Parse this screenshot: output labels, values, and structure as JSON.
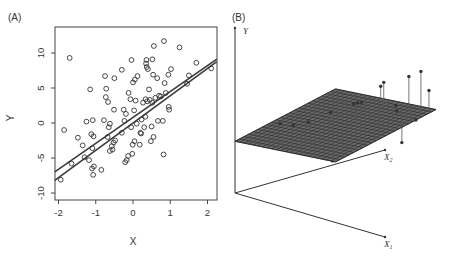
{
  "chart_data": [
    {
      "panel": "A",
      "type": "scatter",
      "panel_label": "(A)",
      "xlabel": "X",
      "ylabel": "Y",
      "xlim": [
        -2.1,
        2.25
      ],
      "ylim": [
        -10.9,
        13.6
      ],
      "xticks": [
        -2,
        -1,
        0,
        1,
        2
      ],
      "yticks": [
        -10,
        -5,
        0,
        5,
        10
      ],
      "xtick_labels": [
        "-2",
        "-1",
        "0",
        "1",
        "2"
      ],
      "ytick_labels": [
        "-10",
        "-5",
        "0",
        "5",
        "10"
      ],
      "grid": false,
      "marker": "open-circle",
      "points": [
        [
          -1.94,
          -8.1
        ],
        [
          -1.85,
          -1.0
        ],
        [
          -1.7,
          9.3
        ],
        [
          -1.65,
          -5.8
        ],
        [
          -1.48,
          -2.1
        ],
        [
          -1.35,
          -3.2
        ],
        [
          -1.3,
          -4.9
        ],
        [
          -1.25,
          0.2
        ],
        [
          -1.18,
          -5.3
        ],
        [
          -1.15,
          4.8
        ],
        [
          -1.12,
          -1.6
        ],
        [
          -1.1,
          -6.5
        ],
        [
          -1.09,
          -3.6
        ],
        [
          -1.08,
          0.4
        ],
        [
          -1.07,
          -7.4
        ],
        [
          -1.06,
          -1.9
        ],
        [
          -1.05,
          -6.2
        ],
        [
          -0.85,
          -6.7
        ],
        [
          -0.78,
          0.4
        ],
        [
          -0.75,
          6.7
        ],
        [
          -0.73,
          3.7
        ],
        [
          -0.72,
          4.9
        ],
        [
          -0.68,
          -2.0
        ],
        [
          -0.67,
          3.0
        ],
        [
          -0.65,
          -0.6
        ],
        [
          -0.62,
          -0.1
        ],
        [
          -0.62,
          -4.0
        ],
        [
          -0.57,
          -3.3
        ],
        [
          -0.55,
          -3.8
        ],
        [
          -0.52,
          -2.8
        ],
        [
          -0.51,
          1.9
        ],
        [
          -0.5,
          6.4
        ],
        [
          -0.48,
          -2.5
        ],
        [
          -0.3,
          7.6
        ],
        [
          -0.3,
          -1.4
        ],
        [
          -0.25,
          1.9
        ],
        [
          -0.23,
          0.3
        ],
        [
          -0.21,
          -5.6
        ],
        [
          -0.19,
          1.3
        ],
        [
          -0.17,
          -5.3
        ],
        [
          -0.13,
          -4.7
        ],
        [
          -0.12,
          4.3
        ],
        [
          -0.07,
          3.4
        ],
        [
          -0.05,
          -0.6
        ],
        [
          -0.04,
          9.0
        ],
        [
          -0.02,
          -4.4
        ],
        [
          -0.01,
          -3.1
        ],
        [
          0.0,
          5.8
        ],
        [
          0.03,
          1.8
        ],
        [
          0.04,
          -2.6
        ],
        [
          0.05,
          6.2
        ],
        [
          0.07,
          3.2
        ],
        [
          0.1,
          -0.1
        ],
        [
          0.12,
          6.7
        ],
        [
          0.18,
          -3.1
        ],
        [
          0.2,
          -1.4
        ],
        [
          0.22,
          -1.5
        ],
        [
          0.23,
          0.5
        ],
        [
          0.27,
          2.9
        ],
        [
          0.3,
          -0.6
        ],
        [
          0.33,
          0.9
        ],
        [
          0.34,
          3.4
        ],
        [
          0.35,
          8.5
        ],
        [
          0.36,
          9.0
        ],
        [
          0.37,
          8.0
        ],
        [
          0.38,
          3.1
        ],
        [
          0.4,
          7.7
        ],
        [
          0.43,
          4.8
        ],
        [
          0.45,
          3.3
        ],
        [
          0.48,
          -2.6
        ],
        [
          0.5,
          -0.5
        ],
        [
          0.52,
          9.1
        ],
        [
          0.52,
          2.9
        ],
        [
          0.54,
          6.9
        ],
        [
          0.55,
          -2.0
        ],
        [
          0.56,
          11.0
        ],
        [
          0.6,
          3.6
        ],
        [
          0.65,
          6.4
        ],
        [
          0.67,
          0.3
        ],
        [
          0.7,
          3.9
        ],
        [
          0.75,
          3.8
        ],
        [
          0.8,
          0.3
        ],
        [
          0.82,
          -4.5
        ],
        [
          0.83,
          11.7
        ],
        [
          0.85,
          5.7
        ],
        [
          0.88,
          4.3
        ],
        [
          0.95,
          6.9
        ],
        [
          0.96,
          2.3
        ],
        [
          0.97,
          1.9
        ],
        [
          1.02,
          7.7
        ],
        [
          1.25,
          10.8
        ],
        [
          1.45,
          5.6
        ],
        [
          1.5,
          6.8
        ],
        [
          1.7,
          8.6
        ],
        [
          2.1,
          7.8
        ]
      ],
      "lines": [
        {
          "name": "population-regression-line",
          "intercept": 0.8,
          "slope": 3.7
        },
        {
          "name": "least-squares-line",
          "intercept": 0.0,
          "slope": 3.9
        }
      ]
    },
    {
      "panel": "B",
      "type": "scatter3d",
      "panel_label": "(B)",
      "axis_labels": {
        "y": "Y",
        "x1": "X",
        "x1_sub": "1",
        "x2": "X",
        "x2_sub": "2"
      },
      "surface": "least-squares regression plane",
      "points": [
        {
          "x1": 0.1,
          "x2": 0.35,
          "y": 0.72
        },
        {
          "x1": 0.28,
          "x2": 0.3,
          "y": 0.8
        },
        {
          "x1": 0.3,
          "x2": 0.32,
          "y": 0.55
        },
        {
          "x1": 0.33,
          "x2": 0.4,
          "y": 0.78
        },
        {
          "x1": 0.35,
          "x2": 0.42,
          "y": 0.58
        },
        {
          "x1": 0.45,
          "x2": 0.5,
          "y": 0.9
        },
        {
          "x1": 0.48,
          "x2": 0.3,
          "y": 0.4
        },
        {
          "x1": 0.52,
          "x2": 0.38,
          "y": 0.48
        },
        {
          "x1": 0.53,
          "x2": 0.4,
          "y": 0.52
        },
        {
          "x1": 0.55,
          "x2": 0.42,
          "y": 0.2
        },
        {
          "x1": 0.56,
          "x2": 0.44,
          "y": 0.5
        },
        {
          "x1": 0.58,
          "x2": 0.6,
          "y": 1.0
        },
        {
          "x1": 0.6,
          "x2": 0.62,
          "y": 1.0
        },
        {
          "x1": 0.62,
          "x2": 0.64,
          "y": 1.0
        },
        {
          "x1": 0.65,
          "x2": 0.4,
          "y": 0.55
        },
        {
          "x1": 0.67,
          "x2": 0.42,
          "y": 0.45
        },
        {
          "x1": 0.7,
          "x2": 0.75,
          "y": 1.2
        },
        {
          "x1": 0.71,
          "x2": 0.77,
          "y": 1.25
        },
        {
          "x1": 0.78,
          "x2": 0.82,
          "y": 0.85
        },
        {
          "x1": 0.85,
          "x2": 0.88,
          "y": 1.3
        },
        {
          "x1": 0.86,
          "x2": 0.75,
          "y": 0.85
        },
        {
          "x1": 0.95,
          "x2": 0.9,
          "y": 1.4
        },
        {
          "x1": 0.96,
          "x2": 0.7,
          "y": 0.4
        },
        {
          "x1": 0.98,
          "x2": 0.95,
          "y": 1.05
        },
        {
          "x1": 1.0,
          "x2": 0.8,
          "y": 0.7
        }
      ]
    }
  ]
}
